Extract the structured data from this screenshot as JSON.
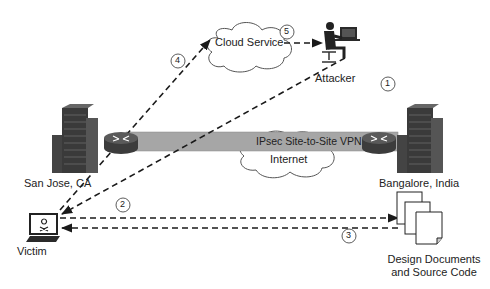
{
  "diagram": {
    "title": "",
    "colors": {
      "line": "#1a1a1a",
      "tunnel_fill": "#a6a6a6",
      "building": "#3c3c3c",
      "cloud_stroke": "#555555"
    },
    "nodes": {
      "cloud_service": {
        "label": "Cloud Service"
      },
      "attacker": {
        "label": "Attacker"
      },
      "san_jose": {
        "label": "San Jose, CA"
      },
      "bangalore": {
        "label": "Bangalore, India"
      },
      "internet": {
        "label": "Internet"
      },
      "vpn": {
        "label": "IPsec Site-to-Site VPN"
      },
      "victim": {
        "label": "Victim"
      },
      "documents": {
        "label_line1": "Design Documents",
        "label_line2": "and Source Code"
      }
    },
    "steps": [
      {
        "number": "1",
        "description": "Attacker to Victim"
      },
      {
        "number": "2",
        "description": "Victim to Design Documents"
      },
      {
        "number": "3",
        "description": "Design Documents to Victim"
      },
      {
        "number": "4",
        "description": "Victim to Cloud Service"
      },
      {
        "number": "5",
        "description": "Cloud Service to Attacker"
      }
    ]
  }
}
